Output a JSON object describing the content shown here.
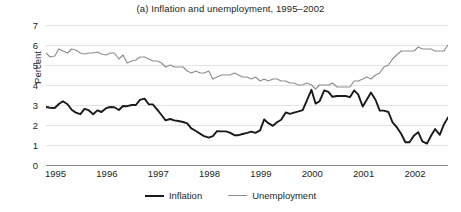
{
  "chart_data": {
    "type": "line",
    "title": "(a) Inflation and unemployment, 1995–2002",
    "xlabel": "",
    "ylabel": "Percent",
    "ylim": [
      0,
      7
    ],
    "xlim": [
      1995.0,
      2002.83
    ],
    "grid": true,
    "legend_position": "bottom-center",
    "y_ticks": [
      0,
      1,
      2,
      3,
      4,
      5,
      6,
      7
    ],
    "y_tick_labels": [
      "0",
      "1",
      "2",
      "3",
      "4",
      "5",
      "6",
      "7"
    ],
    "x_ticks": [
      1995,
      1996,
      1997,
      1998,
      1999,
      2000,
      2001,
      2002
    ],
    "x_tick_labels": [
      "1995",
      "1996",
      "1997",
      "1998",
      "1999",
      "2000",
      "2001",
      "2002"
    ],
    "x": [
      1995.0,
      1995.08,
      1995.17,
      1995.25,
      1995.33,
      1995.42,
      1995.5,
      1995.58,
      1995.67,
      1995.75,
      1995.83,
      1995.92,
      1996.0,
      1996.08,
      1996.17,
      1996.25,
      1996.33,
      1996.42,
      1996.5,
      1996.58,
      1996.67,
      1996.75,
      1996.83,
      1996.92,
      1997.0,
      1997.08,
      1997.17,
      1997.25,
      1997.33,
      1997.42,
      1997.5,
      1997.58,
      1997.67,
      1997.75,
      1997.83,
      1997.92,
      1998.0,
      1998.08,
      1998.17,
      1998.25,
      1998.33,
      1998.42,
      1998.5,
      1998.58,
      1998.67,
      1998.75,
      1998.83,
      1998.92,
      1999.0,
      1999.08,
      1999.17,
      1999.25,
      1999.33,
      1999.42,
      1999.5,
      1999.58,
      1999.67,
      1999.75,
      1999.83,
      1999.92,
      2000.0,
      2000.08,
      2000.17,
      2000.25,
      2000.33,
      2000.42,
      2000.5,
      2000.58,
      2000.67,
      2000.75,
      2000.83,
      2000.92,
      2001.0,
      2001.08,
      2001.17,
      2001.25,
      2001.33,
      2001.42,
      2001.5,
      2001.58,
      2001.67,
      2001.75,
      2001.83,
      2001.92,
      2002.0,
      2002.08,
      2002.17,
      2002.25,
      2002.33,
      2002.42,
      2002.5,
      2002.58,
      2002.67,
      2002.75,
      2002.83
    ],
    "series": [
      {
        "name": "Inflation",
        "color": "#1a1a1a",
        "values": [
          2.9,
          2.86,
          2.85,
          3.05,
          3.19,
          3.04,
          2.76,
          2.62,
          2.54,
          2.81,
          2.74,
          2.54,
          2.73,
          2.65,
          2.84,
          2.9,
          2.89,
          2.75,
          2.95,
          2.94,
          3.0,
          3.0,
          3.26,
          3.32,
          3.04,
          3.03,
          2.76,
          2.5,
          2.23,
          2.3,
          2.23,
          2.2,
          2.15,
          2.08,
          1.83,
          1.7,
          1.57,
          1.44,
          1.37,
          1.44,
          1.69,
          1.68,
          1.68,
          1.62,
          1.49,
          1.49,
          1.55,
          1.61,
          1.67,
          1.61,
          1.73,
          2.28,
          2.09,
          1.96,
          2.14,
          2.26,
          2.63,
          2.56,
          2.62,
          2.68,
          2.74,
          3.22,
          3.76,
          3.07,
          3.19,
          3.73,
          3.66,
          3.41,
          3.45,
          3.45,
          3.45,
          3.39,
          3.73,
          3.53,
          2.92,
          3.27,
          3.62,
          3.25,
          2.72,
          2.72,
          2.65,
          2.13,
          1.9,
          1.55,
          1.14,
          1.14,
          1.48,
          1.64,
          1.18,
          1.07,
          1.46,
          1.8,
          1.51,
          2.03,
          2.38
        ]
      },
      {
        "name": "Unemployment",
        "color": "#8e8e88",
        "values": [
          5.6,
          5.4,
          5.45,
          5.8,
          5.7,
          5.6,
          5.8,
          5.75,
          5.6,
          5.55,
          5.6,
          5.6,
          5.65,
          5.55,
          5.5,
          5.6,
          5.6,
          5.3,
          5.5,
          5.1,
          5.2,
          5.25,
          5.4,
          5.4,
          5.3,
          5.2,
          5.2,
          5.1,
          4.9,
          5.0,
          4.9,
          4.9,
          4.9,
          4.7,
          4.6,
          4.7,
          4.6,
          4.6,
          4.7,
          4.3,
          4.4,
          4.5,
          4.5,
          4.5,
          4.6,
          4.5,
          4.4,
          4.4,
          4.3,
          4.4,
          4.2,
          4.3,
          4.2,
          4.3,
          4.3,
          4.2,
          4.2,
          4.1,
          4.1,
          4.0,
          4.0,
          4.1,
          4.0,
          3.8,
          4.0,
          4.0,
          4.0,
          4.1,
          3.9,
          3.9,
          3.9,
          3.9,
          4.2,
          4.2,
          4.3,
          4.4,
          4.3,
          4.5,
          4.6,
          4.9,
          5.0,
          5.3,
          5.5,
          5.7,
          5.7,
          5.7,
          5.7,
          5.9,
          5.8,
          5.8,
          5.8,
          5.7,
          5.7,
          5.7,
          6.0
        ]
      }
    ]
  },
  "legend": {
    "items": [
      {
        "label": "Inflation"
      },
      {
        "label": "Unemployment"
      }
    ]
  }
}
